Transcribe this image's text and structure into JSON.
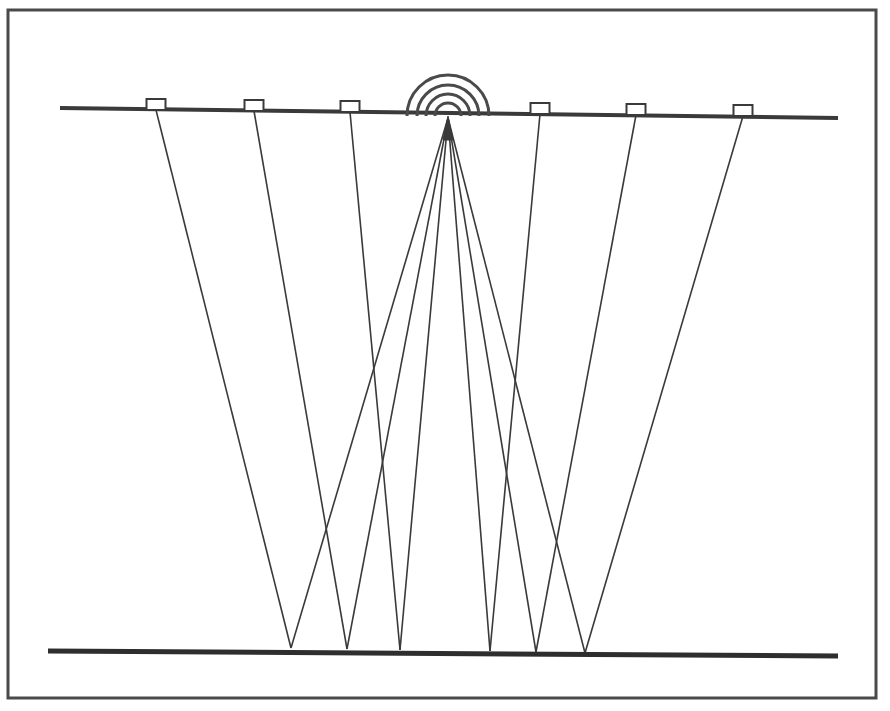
{
  "figure": {
    "kind": "seismic-reflection-ray-path-diagram",
    "background_color": "#ffffff",
    "width": 890,
    "height": 711
  },
  "frame": {
    "x": 8,
    "y": 10,
    "width": 868,
    "height": 688,
    "stroke_color": "#4a4a4a",
    "stroke_width": 3
  },
  "chart_data": {
    "type": "scatter",
    "title": "",
    "xlabel": "",
    "ylabel": "",
    "grid": false,
    "legend": false,
    "xlim": [
      0,
      890
    ],
    "ylim": [
      711,
      0
    ],
    "surface": {
      "label": "ground-surface",
      "x1": 60,
      "y1": 108,
      "x2": 838,
      "y2": 118,
      "color": "#3a3a3a",
      "width": 4
    },
    "reflector": {
      "label": "reflector-interface",
      "x1": 48,
      "y1": 651,
      "x2": 838,
      "y2": 656,
      "color": "#2e2e2e",
      "width": 5
    },
    "source": {
      "label": "shot-point-source",
      "x": 448,
      "y": 118,
      "marker_color": "#3a3a3a",
      "wave_arc_radii": [
        13,
        22,
        31,
        41
      ],
      "wave_arc_color": "#4a4a4a",
      "wave_arc_width": 3
    },
    "geophones": [
      {
        "id": "geophone-1",
        "x": 156,
        "y": 110,
        "box_width": 19,
        "box_height": 11
      },
      {
        "id": "geophone-2",
        "x": 254,
        "y": 111,
        "box_width": 19,
        "box_height": 11
      },
      {
        "id": "geophone-3",
        "x": 350,
        "y": 112,
        "box_width": 19,
        "box_height": 11
      },
      {
        "id": "geophone-4",
        "x": 540,
        "y": 114,
        "box_width": 19,
        "box_height": 11
      },
      {
        "id": "geophone-5",
        "x": 636,
        "y": 115,
        "box_width": 19,
        "box_height": 11
      },
      {
        "id": "geophone-6",
        "x": 743,
        "y": 116,
        "box_width": 19,
        "box_height": 11
      }
    ],
    "geophone_style": {
      "stroke_color": "#3a3a3a",
      "stroke_width": 2,
      "fill": "#ffffff"
    },
    "reflection_points": [
      {
        "id": "reflection-point-1",
        "x": 291,
        "y": 648
      },
      {
        "id": "reflection-point-2",
        "x": 347,
        "y": 649
      },
      {
        "id": "reflection-point-3",
        "x": 400,
        "y": 650
      },
      {
        "id": "reflection-point-4",
        "x": 490,
        "y": 651
      },
      {
        "id": "reflection-point-5",
        "x": 536,
        "y": 652
      },
      {
        "id": "reflection-point-6",
        "x": 585,
        "y": 653
      }
    ],
    "ray_style": {
      "color": "#3a3a3a",
      "width": 1.6
    },
    "raypaths": [
      {
        "id": "raypath-1",
        "receiver": "geophone-1",
        "reflection": "reflection-point-1",
        "down": [
          448,
          118,
          291,
          648
        ],
        "up": [
          291,
          648,
          156,
          110
        ]
      },
      {
        "id": "raypath-2",
        "receiver": "geophone-2",
        "reflection": "reflection-point-2",
        "down": [
          448,
          118,
          347,
          649
        ],
        "up": [
          347,
          649,
          254,
          111
        ]
      },
      {
        "id": "raypath-3",
        "receiver": "geophone-3",
        "reflection": "reflection-point-3",
        "down": [
          448,
          118,
          400,
          650
        ],
        "up": [
          400,
          650,
          350,
          112
        ]
      },
      {
        "id": "raypath-4",
        "receiver": "geophone-4",
        "reflection": "reflection-point-4",
        "down": [
          448,
          118,
          490,
          651
        ],
        "up": [
          490,
          651,
          540,
          114
        ]
      },
      {
        "id": "raypath-5",
        "receiver": "geophone-5",
        "reflection": "reflection-point-5",
        "down": [
          448,
          118,
          536,
          652
        ],
        "up": [
          536,
          652,
          636,
          115
        ]
      },
      {
        "id": "raypath-6",
        "receiver": "geophone-6",
        "reflection": "reflection-point-6",
        "down": [
          448,
          118,
          585,
          653
        ],
        "up": [
          585,
          653,
          743,
          116
        ]
      }
    ]
  }
}
